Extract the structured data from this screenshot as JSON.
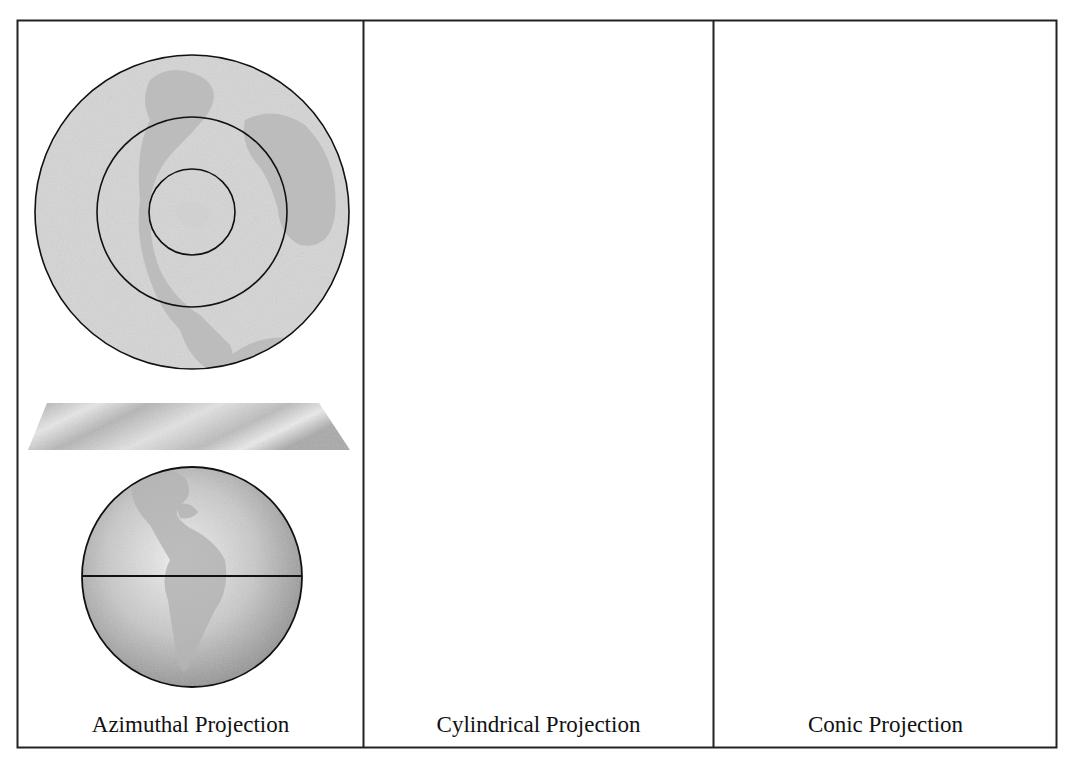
{
  "figure": {
    "panels": [
      {
        "id": "azimuthal",
        "label": "Azimuthal Projection",
        "surface": "plane",
        "projected_map": "polar circular map with 3 concentric parallels"
      },
      {
        "id": "cylindrical",
        "label": "Cylindrical Projection",
        "surface": "cylinder",
        "projected_map": "rectangular world map with 9 horizontal parallels"
      },
      {
        "id": "conic",
        "label": "Conic Projection",
        "surface": "cone",
        "projected_map": "fan-shaped map with 6 concentric arcs"
      }
    ],
    "colors": {
      "frame": "#222222",
      "map_fill": "#d9d9d9",
      "land_fill": "#bdbdbd",
      "globe_light": "#e6e6e6",
      "globe_dark": "#8f8f8f",
      "lines": "#111111"
    }
  }
}
